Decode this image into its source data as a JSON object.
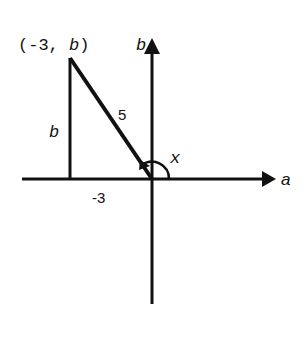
{
  "diagram": {
    "type": "coordinate-plane-triangle",
    "axes": {
      "horizontal_label": "a",
      "vertical_label": "b"
    },
    "point_label": {
      "open": "(-3, ",
      "var": "b",
      "close": ")"
    },
    "labels": {
      "hypotenuse": "5",
      "vertical_leg": "b",
      "horizontal_leg": "-3",
      "angle": "x"
    },
    "colors": {
      "stroke": "#111111",
      "background": "#ffffff"
    }
  }
}
